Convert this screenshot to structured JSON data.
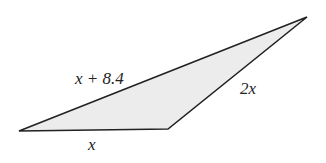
{
  "diagram": {
    "type": "triangle",
    "fill_color": "#ececec",
    "stroke_color": "#222222",
    "vertices": {
      "left": [
        19,
        131
      ],
      "bottom_right": [
        168,
        129
      ],
      "top_right": [
        307,
        17
      ]
    },
    "sides": {
      "long_side_label": "x + 8.4",
      "right_side_label": "2x",
      "bottom_side_label": "x"
    }
  }
}
